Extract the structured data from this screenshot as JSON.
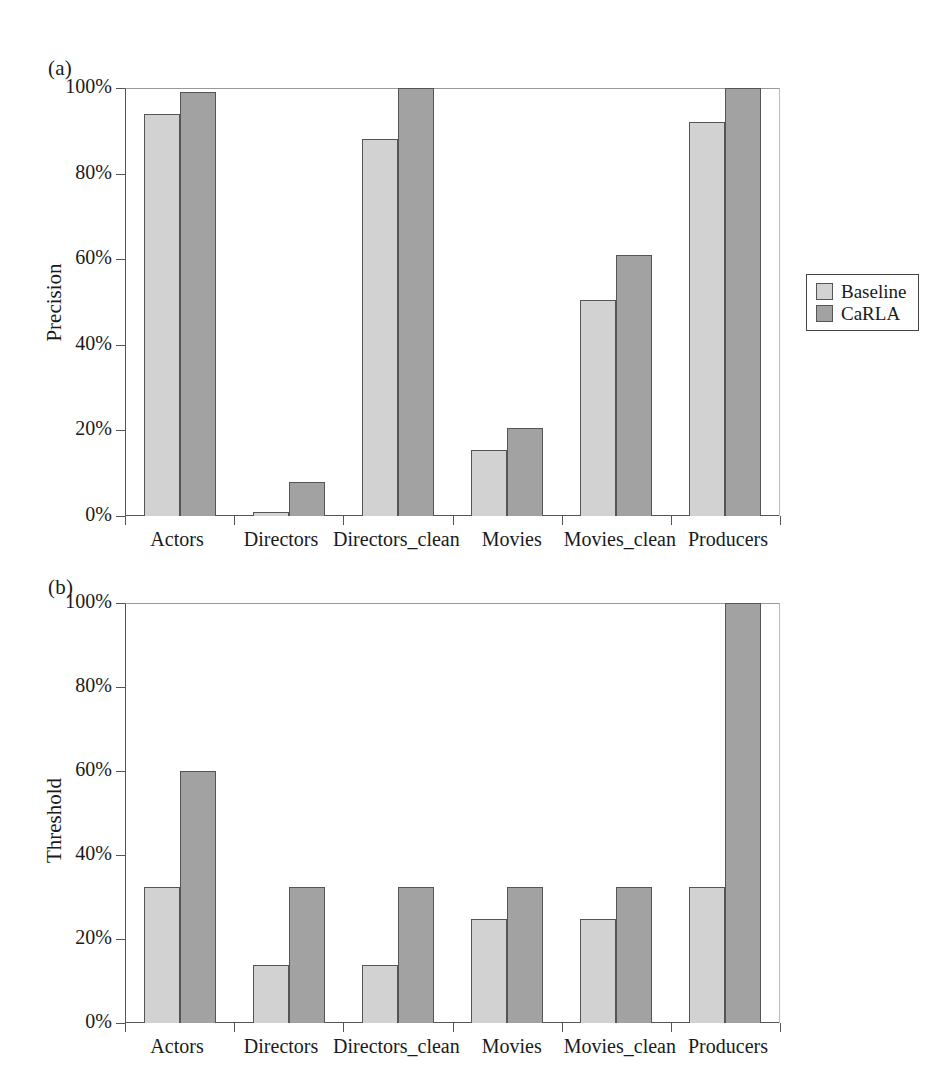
{
  "figure": {
    "background": "#ffffff",
    "colors": {
      "baseline": "#d2d2d2",
      "carla": "#a2a2a2",
      "axis": "#555555",
      "text": "#1a1a1a"
    }
  },
  "panels": {
    "a": {
      "label": "(a)",
      "ylabel": "Precision",
      "yticks": [
        "0%",
        "20%",
        "40%",
        "60%",
        "80%",
        "100%"
      ]
    },
    "b": {
      "label": "(b)",
      "ylabel": "Threshold",
      "yticks": [
        "0%",
        "20%",
        "40%",
        "60%",
        "80%",
        "100%"
      ]
    }
  },
  "legend": {
    "position": "right",
    "entries": [
      {
        "label": "Baseline",
        "color": "#d2d2d2",
        "key": "baseline"
      },
      {
        "label": "CaRLA",
        "color": "#a2a2a2",
        "key": "carla"
      }
    ]
  },
  "chart_data": [
    {
      "type": "bar",
      "panel": "(a)",
      "title": "",
      "xlabel": "",
      "ylabel": "Precision",
      "ylim": [
        0,
        100
      ],
      "yticks": [
        0,
        20,
        40,
        60,
        80,
        100
      ],
      "ytick_labels": [
        "0%",
        "20%",
        "40%",
        "60%",
        "80%",
        "100%"
      ],
      "grid": false,
      "legend_position": "right",
      "categories": [
        "Actors",
        "Directors",
        "Directors_clean",
        "Movies",
        "Movies_clean",
        "Producers"
      ],
      "series": [
        {
          "name": "Baseline",
          "color": "#d2d2d2",
          "values": [
            94,
            1,
            88,
            15.5,
            50.5,
            92
          ]
        },
        {
          "name": "CaRLA",
          "color": "#a2a2a2",
          "values": [
            99,
            8,
            100,
            20.5,
            61,
            100
          ]
        }
      ]
    },
    {
      "type": "bar",
      "panel": "(b)",
      "title": "",
      "xlabel": "",
      "ylabel": "Threshold",
      "ylim": [
        0,
        100
      ],
      "yticks": [
        0,
        20,
        40,
        60,
        80,
        100
      ],
      "ytick_labels": [
        "0%",
        "20%",
        "40%",
        "60%",
        "80%",
        "100%"
      ],
      "grid": false,
      "legend_position": "right",
      "categories": [
        "Actors",
        "Directors",
        "Directors_clean",
        "Movies",
        "Movies_clean",
        "Producers"
      ],
      "series": [
        {
          "name": "Baseline",
          "color": "#d2d2d2",
          "values": [
            32.5,
            13.8,
            13.8,
            24.8,
            24.8,
            32.5
          ]
        },
        {
          "name": "CaRLA",
          "color": "#a2a2a2",
          "values": [
            60,
            32.5,
            32.5,
            32.5,
            32.5,
            100
          ]
        }
      ]
    }
  ]
}
